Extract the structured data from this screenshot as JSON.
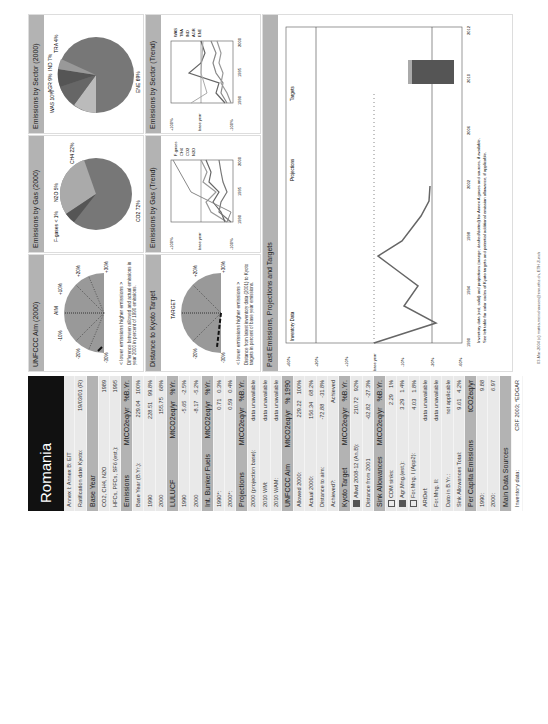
{
  "country": "Romania",
  "sidebar": {
    "rows": [
      {
        "type": "row",
        "label": "Annex I: Annex B: EIT",
        "v1": "",
        "v2": ""
      },
      {
        "type": "row",
        "label": "Ratification date Kyoto:",
        "v1": "",
        "v2": "19/03/01 (R)"
      },
      {
        "type": "hdr",
        "label": "Base Year",
        "v1": "",
        "v2": ""
      },
      {
        "type": "row",
        "label": "CO2, CH4, N2O",
        "v1": "",
        "v2": "1989"
      },
      {
        "type": "row",
        "label": "HFCs, PFCs, SF6 (est.):",
        "v1": "",
        "v2": "1995"
      },
      {
        "type": "hdr",
        "label": "Emissions",
        "v1": "MtCO2eq/yr",
        "v2": "%B.Yr."
      },
      {
        "type": "row",
        "label": "Base Year (B.Yr.):",
        "v1": "229.04",
        "v2": "100%"
      },
      {
        "type": "row",
        "label": "1990",
        "v1": "228.51",
        "v2": "99.8%"
      },
      {
        "type": "row",
        "label": "2000",
        "v1": "155.75",
        "v2": "68%"
      },
      {
        "type": "hdr",
        "label": "LULUCF",
        "v1": "MtCO2eq/yr",
        "v2": "%Yr."
      },
      {
        "type": "row",
        "label": "1990",
        "v1": "-5.65",
        "v2": "-2.5%"
      },
      {
        "type": "row",
        "label": "2000",
        "v1": "-8.17",
        "v2": "-5.2%"
      },
      {
        "type": "hdr",
        "label": "Int. Bunker Fuels",
        "v1": "MtCO2eq/yr",
        "v2": "%Yr."
      },
      {
        "type": "row",
        "label": "1990*:",
        "v1": "0.71",
        "v2": "0.3%"
      },
      {
        "type": "row",
        "label": "2000*:",
        "v1": "0.59",
        "v2": "0.4%"
      },
      {
        "type": "hdr",
        "label": "Projections",
        "v1": "MtCO2eq/yr",
        "v2": "%B.Yr."
      },
      {
        "type": "row",
        "label": "2000 (projection base):",
        "v1": "",
        "v2": "data unavailable"
      },
      {
        "type": "row",
        "label": "2010 WM:",
        "v1": "",
        "v2": "data unavailable"
      },
      {
        "type": "row",
        "label": "2010 WAM:",
        "v1": "",
        "v2": "data unavailable"
      },
      {
        "type": "hdr",
        "label": "UNFCCC Aim",
        "v1": "MtCO2eq/yr",
        "v2": "% 1990"
      },
      {
        "type": "row",
        "label": "Allowed 2000:",
        "v1": "229.22",
        "v2": "100%"
      },
      {
        "type": "row",
        "label": "Actual 2000:",
        "v1": "156.34",
        "v2": "68.2%"
      },
      {
        "type": "row",
        "label": "Distance to aim:",
        "v1": "-72.88",
        "v2": "-31.8%"
      },
      {
        "type": "row",
        "label": "Achieved?:",
        "v1": "",
        "v2": "Achieved"
      },
      {
        "type": "hdr",
        "label": "Kyoto Target",
        "v1": "MtCO2eq/yr",
        "v2": "%B.Yr."
      },
      {
        "type": "row",
        "label": "Allwd 2008-12 (An.B):",
        "v1": "210.72",
        "v2": "92%",
        "sq": "f"
      },
      {
        "type": "row",
        "label": "Distance from 2001",
        "v1": "-62.82",
        "v2": "-27.3%"
      },
      {
        "type": "hdr",
        "label": "Sink Allowances",
        "v1": "MtCO2eq/yr",
        "v2": "%B.Yr."
      },
      {
        "type": "row",
        "label": "CDM sinks:",
        "v1": "2.29",
        "v2": "1%",
        "sq": "e"
      },
      {
        "type": "row",
        "label": "Agr.Mng.(est.):",
        "v1": "3.29",
        "v2": "1.4%",
        "sq": "f"
      },
      {
        "type": "row",
        "label": "For.Mng. I (App2):",
        "v1": "4.03",
        "v2": "1.8%",
        "sq": "e"
      },
      {
        "type": "row",
        "label": "ARtDef:",
        "v1": "",
        "v2": "data unavailable"
      },
      {
        "type": "row",
        "label": "For.Mng. II:",
        "v1": "",
        "v2": "data unavailable"
      },
      {
        "type": "row",
        "label": "Dato in B.Yr.:",
        "v1": "",
        "v2": "not applicable"
      },
      {
        "type": "row",
        "label": "Sink Allowances Total:",
        "v1": "9.61",
        "v2": "4.2%"
      },
      {
        "type": "hdr",
        "label": "Per Capita Emissions",
        "v1": "",
        "v2": "tCO2eq/yr"
      },
      {
        "type": "row",
        "label": "1990:",
        "v1": "",
        "v2": "9.88"
      },
      {
        "type": "row",
        "label": "2000:",
        "v1": "",
        "v2": "6.97"
      },
      {
        "type": "hdr",
        "label": "Main Data Sources",
        "v1": "",
        "v2": ""
      },
      {
        "type": "row",
        "label": "Inventory data:",
        "v1": "",
        "v2": "CRF 2003; *EDGAR"
      }
    ]
  },
  "panels": {
    "unfccc_aim": {
      "title": "UNFCCC Aim (2000)",
      "center_label": "AIM",
      "ticks": [
        "-30%",
        "-20%",
        "-10%",
        "+10%",
        "+20%",
        "+30%"
      ],
      "legend": "< lower emissions    higher emissions >",
      "caption": "Difference between allowed and actual emissions in year 2000 in percent of 1990 emissions."
    },
    "kyoto": {
      "title": "Distance to Kyoto Target",
      "center_label": "TARGET",
      "ticks": [
        "-30%",
        "-20%",
        "-10%",
        "+10%",
        "+20%",
        "+30%"
      ],
      "legend": "< lower emissions    higher emissions >",
      "caption": "Distance from latest inventory data (2001) to Kyoto targets in percent of base year emissions."
    },
    "gas_pie": {
      "title": "Emissions by Gas (2000)",
      "labels": [
        "CO2 72%",
        "CH4 22%",
        "N2O 5%",
        "F-gases < 1%"
      ]
    },
    "sector_pie": {
      "title": "Emissions by Sector (2000)",
      "labels": [
        "ENE 69%",
        "WAS 10%",
        "AGR 9%",
        "IND 7%",
        "TRA 4%"
      ]
    },
    "gas_trend": {
      "title": "Emissions by Gas (Trend)",
      "yticks": [
        "+100%",
        "+50%",
        "+20%",
        "+10%",
        "base year",
        "-10%",
        "-20%",
        "-50%",
        "-100%"
      ],
      "xticks": [
        "1990",
        "1995",
        "2000"
      ],
      "legend": [
        "F-gases",
        "CH4",
        "CO2",
        "N2O"
      ]
    },
    "sector_trend": {
      "title": "Emissions by Sector (Trend)",
      "yticks": [
        "+100%",
        "+50%",
        "+20%",
        "+10%",
        "base year",
        "-10%",
        "-20%",
        "-50%",
        "-100%"
      ],
      "xticks": [
        "1990",
        "1995",
        "2000"
      ],
      "legend": [
        "WAS",
        "TRA",
        "IND",
        "AGR",
        "ENE"
      ]
    },
    "past": {
      "title": "Past Emissions, Projections and Targets",
      "section_labels": [
        "Inventory Data",
        "Projections",
        "Targets"
      ],
      "yticks": [
        "+60%",
        "+50%",
        "+40%",
        "+30%",
        "+20%",
        "+10%",
        "base year",
        "-10%",
        "-20%",
        "-30%",
        "-40%",
        "-50%",
        "-60%"
      ],
      "xticks": [
        "1990",
        "1992",
        "1994",
        "1996",
        "1998",
        "2000",
        "2002",
        "2004",
        "2006",
        "2008",
        "2010",
        "2012"
      ],
      "note1": "Inventory data (red; solid) and projections (orange; dashed/dotted) for Annex A gases and sources, if available.",
      "note2": "See left table for color codes of Kyoto targets and potential additional emission allowance, if applicable."
    }
  },
  "footer": "03-Mar-2004 (c) mattia.meinshausen@env.ethz.ch, ETH Zurich",
  "chart_data": {
    "type": "line",
    "title": "Past Emissions, Projections and Targets",
    "x": [
      1989,
      1990,
      1991,
      1992,
      1993,
      1994,
      1995,
      1996,
      1997,
      1998,
      1999,
      2000,
      2001
    ],
    "values": [
      0,
      -1,
      -21,
      -12,
      -17,
      -23,
      -10,
      -13,
      -22,
      -29,
      -33,
      -32,
      -31
    ],
    "ylabel": "% of base year",
    "ylim": [
      -60,
      60
    ]
  }
}
